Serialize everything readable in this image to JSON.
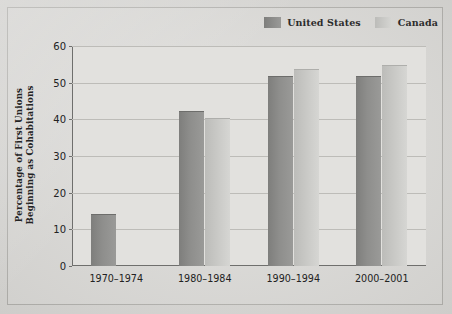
{
  "chart_data": {
    "type": "bar",
    "title": "",
    "xlabel": "",
    "ylabel": "Percentage of First Unions Beginning as Cohabitations",
    "ylabel_lines": [
      "Percentage of First Unions",
      "Beginning as Cohabitations"
    ],
    "categories": [
      "1970–1974",
      "1980–1984",
      "1990–1994",
      "2000–2001"
    ],
    "series": [
      {
        "name": "United States",
        "color": "#8b8b89",
        "values": [
          14,
          42,
          51.5,
          51.5
        ]
      },
      {
        "name": "Canada",
        "color": "#c9c9c6",
        "values": [
          null,
          40,
          53.5,
          54.5
        ]
      }
    ],
    "ylim": [
      0,
      60
    ],
    "yticks": [
      0,
      10,
      20,
      30,
      40,
      50,
      60
    ],
    "ytick_labels": [
      "0",
      "10",
      "20",
      "30",
      "40",
      "50",
      "60"
    ],
    "grid": true,
    "legend_position": "top-right"
  },
  "legend": {
    "items": [
      {
        "label": "United States",
        "swatch": "#8b8b89"
      },
      {
        "label": "Canada",
        "swatch": "#c9c9c6"
      }
    ]
  },
  "colors": {
    "page_background": "#d9d8d5",
    "frame_background": "#dcdbd8",
    "plot_background": "#e2e1de",
    "axis": "#6f6f6d",
    "gridline": "#bdbcb8",
    "text": "#222222"
  }
}
